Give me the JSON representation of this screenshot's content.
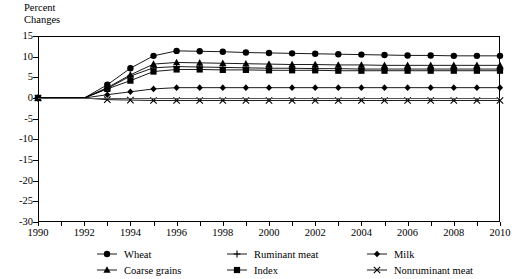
{
  "chart_data": {
    "type": "line",
    "title": "",
    "ylabel": "Percent Changes",
    "xlabel": "",
    "ylim": [
      -30,
      15
    ],
    "ytick_step": 5,
    "yticks": [
      15,
      10,
      5,
      0,
      -5,
      -10,
      -15,
      -20,
      -25,
      -30
    ],
    "xlim": [
      1990,
      2010
    ],
    "xticks_labeled": [
      1990,
      1992,
      1994,
      1996,
      1998,
      2000,
      2002,
      2004,
      2006,
      2008,
      2010
    ],
    "xtick_minor_step": 1,
    "grid": false,
    "legend_position": "bottom",
    "x": [
      1990,
      1991,
      1992,
      1993,
      1994,
      1995,
      1996,
      1997,
      1998,
      1999,
      2000,
      2001,
      2002,
      2003,
      2004,
      2005,
      2006,
      2007,
      2008,
      2009,
      2010
    ],
    "series": [
      {
        "name": "Wheat",
        "marker": "circle",
        "values": [
          0,
          0,
          0,
          3.2,
          7.2,
          10.2,
          11.4,
          11.3,
          11.2,
          11.0,
          10.9,
          10.8,
          10.7,
          10.6,
          10.5,
          10.4,
          10.3,
          10.3,
          10.2,
          10.2,
          10.2
        ]
      },
      {
        "name": "Coarse grains",
        "marker": "triangle",
        "values": [
          0,
          0,
          0,
          2.5,
          5.6,
          8.2,
          8.6,
          8.5,
          8.4,
          8.3,
          8.2,
          8.1,
          8.1,
          8.0,
          8.0,
          7.9,
          7.9,
          7.9,
          7.9,
          7.9,
          7.9
        ]
      },
      {
        "name": "Ruminant meat",
        "marker": "plus",
        "values": [
          0,
          0,
          0,
          2.3,
          5.3,
          7.3,
          7.6,
          7.5,
          7.4,
          7.3,
          7.2,
          7.2,
          7.1,
          7.1,
          7.0,
          7.0,
          7.0,
          7.0,
          7.0,
          7.0,
          7.0
        ]
      },
      {
        "name": "Index",
        "marker": "square",
        "values": [
          0,
          0,
          0,
          2.2,
          4.2,
          6.4,
          6.9,
          6.9,
          6.8,
          6.8,
          6.7,
          6.7,
          6.7,
          6.6,
          6.6,
          6.6,
          6.6,
          6.6,
          6.6,
          6.6,
          6.6
        ]
      },
      {
        "name": "Milk",
        "marker": "diamond",
        "values": [
          0,
          0,
          0,
          0.8,
          1.5,
          2.2,
          2.5,
          2.5,
          2.5,
          2.5,
          2.5,
          2.5,
          2.5,
          2.5,
          2.5,
          2.5,
          2.5,
          2.5,
          2.5,
          2.5,
          2.5
        ]
      },
      {
        "name": "Nonruminant meat",
        "marker": "cross",
        "values": [
          0,
          0,
          0,
          -0.4,
          -0.5,
          -0.6,
          -0.6,
          -0.6,
          -0.6,
          -0.6,
          -0.6,
          -0.6,
          -0.6,
          -0.6,
          -0.6,
          -0.6,
          -0.6,
          -0.6,
          -0.6,
          -0.6,
          -0.6
        ]
      }
    ]
  },
  "axis_title_text": "Percent\nChanges",
  "legend": {
    "entries": [
      {
        "label": "Wheat",
        "marker": "circle"
      },
      {
        "label": "Ruminant meat",
        "marker": "plus"
      },
      {
        "label": "Milk",
        "marker": "diamond"
      },
      {
        "label": "Coarse grains",
        "marker": "triangle"
      },
      {
        "label": "Index",
        "marker": "square"
      },
      {
        "label": "Nonruminant meat",
        "marker": "cross"
      }
    ]
  },
  "colors": {
    "line": "#000000",
    "zero_line": "#555555",
    "axis": "#000000"
  }
}
